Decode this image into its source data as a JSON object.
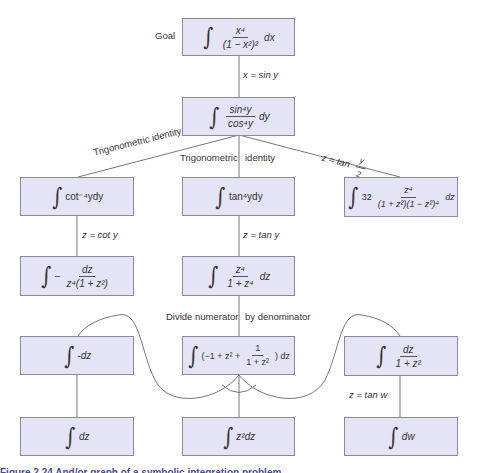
{
  "goal_label": "Goal",
  "nodes": {
    "goal": {
      "integral": "∫",
      "num": "x⁴",
      "den": "(1 − x²)²",
      "diff": "dx"
    },
    "sin_cos": {
      "integral": "∫",
      "num": "sin⁴y",
      "den": "cos⁴y",
      "diff": "dy"
    },
    "cot": {
      "integral": "∫",
      "body": "cot⁻⁴ydy"
    },
    "tan": {
      "integral": "∫",
      "body": "tan⁴ydy"
    },
    "halfangle": {
      "integral": "∫",
      "coef": "32",
      "num": "z⁴",
      "den": "(1 + z²)(1 − z²)⁴",
      "diff": "dz"
    },
    "cot_sub": {
      "integral": "∫",
      "prefix": "−",
      "num": "dz",
      "den": "z⁴(1 + z²)"
    },
    "tan_sub": {
      "integral": "∫",
      "num": "z⁴",
      "den": "1 + z⁴",
      "diff": "dz"
    },
    "neg_dz": {
      "integral": "∫",
      "body": "-dz"
    },
    "divided": {
      "integral": "∫",
      "pre": "(−1 + z² +",
      "num": "1",
      "den": "1 + z²",
      "post": ") dz"
    },
    "arctan": {
      "integral": "∫",
      "num": "dz",
      "den": "1 + z²"
    },
    "dz": {
      "integral": "∫",
      "body": "dz"
    },
    "z2dz": {
      "integral": "∫",
      "body": "z²dz"
    },
    "dw": {
      "integral": "∫",
      "body": "dw"
    }
  },
  "edges": {
    "x_sin_y": "x  = sin y",
    "trig_identity_left": "Trigonometric identity",
    "trig_identity_mid_a": "Trigonometric",
    "trig_identity_mid_b": "identity",
    "z_tan_half": "z  = tan",
    "z_tan_half_num": "y",
    "z_tan_half_den": "2",
    "z_cot_y": "z  = cot y",
    "z_tan_y": "z  = tan y",
    "divide_a": "Divide numerator",
    "divide_b": "by denominator",
    "z_tan_w": "z  = tan w"
  },
  "caption": "Figure 2.24  And/or graph of a symbolic integration problem",
  "colors": {
    "box_fill": "#e4e4f6",
    "box_border": "#8a8a9a",
    "line": "#555555"
  }
}
